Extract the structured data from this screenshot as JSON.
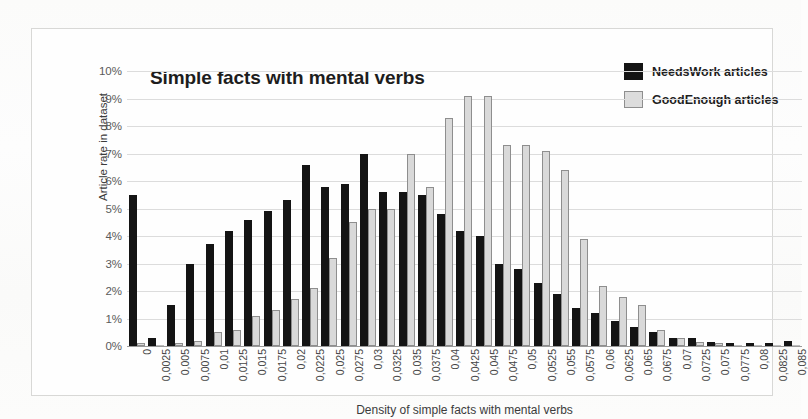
{
  "chart_data": {
    "type": "bar",
    "title": "Simple facts with mental verbs",
    "xlabel": "Density of simple facts with mental verbs",
    "ylabel": "Article rate in dataset",
    "ylim": [
      0,
      10
    ],
    "ytick_labels": [
      "10%",
      "9%",
      "8%",
      "7%",
      "6%",
      "5%",
      "4%",
      "3%",
      "2%",
      "1%",
      "0%"
    ],
    "ytick_values": [
      10,
      9,
      8,
      7,
      6,
      5,
      4,
      3,
      2,
      1,
      0
    ],
    "grid": true,
    "legend_position": "top-right",
    "categories": [
      "0",
      "0,0025",
      "0,005",
      "0,0075",
      "0,01",
      "0,0125",
      "0,015",
      "0,0175",
      "0,02",
      "0,0225",
      "0,025",
      "0,0275",
      "0,03",
      "0,0325",
      "0,035",
      "0,0375",
      "0,04",
      "0,0425",
      "0,045",
      "0,0475",
      "0,05",
      "0,0525",
      "0,055",
      "0,0575",
      "0,06",
      "0,0625",
      "0,065",
      "0,0675",
      "0,07",
      "0,0725",
      "0,075",
      "0,0775",
      "0,08",
      "0,0825",
      "0,085"
    ],
    "series": [
      {
        "name": "NeedsWork articles",
        "color": "#141414",
        "values": [
          5.5,
          0.3,
          1.5,
          3.0,
          3.7,
          4.2,
          4.6,
          4.9,
          5.3,
          6.6,
          5.8,
          5.9,
          7.0,
          5.6,
          5.6,
          5.5,
          4.8,
          4.2,
          4.0,
          3.0,
          2.8,
          2.3,
          1.9,
          1.4,
          1.2,
          0.9,
          0.7,
          0.5,
          0.3,
          0.3,
          0.15,
          0.1,
          0.1,
          0.1,
          0.2
        ]
      },
      {
        "name": "GoodEnough articles",
        "color": "#d9d9d9",
        "values": [
          0.1,
          0.05,
          0.1,
          0.2,
          0.5,
          0.6,
          1.1,
          1.3,
          1.7,
          2.1,
          3.2,
          4.5,
          5.0,
          5.0,
          7.0,
          5.8,
          8.3,
          9.1,
          9.1,
          7.3,
          7.3,
          7.1,
          6.4,
          3.9,
          2.2,
          1.8,
          1.5,
          0.6,
          0.3,
          0.15,
          0.1,
          0.05,
          0.05,
          0.05,
          0.05
        ]
      }
    ]
  }
}
